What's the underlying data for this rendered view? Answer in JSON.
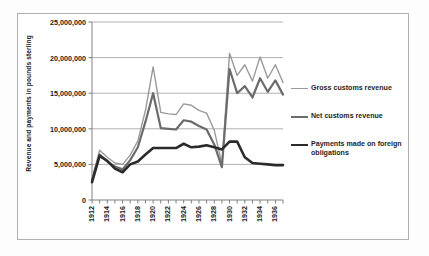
{
  "chart_data": {
    "type": "line",
    "title": "",
    "xlabel": "",
    "ylabel": "Revenue  and payments in pounds sterling",
    "ylim": [
      0,
      25000000
    ],
    "xlim": [
      1912,
      1937
    ],
    "grid": true,
    "legend_position": "right",
    "ytick_labels": [
      "25,000,000",
      "20,000,000",
      "15,000,000",
      "10,000,000",
      "5,000,000",
      "0"
    ],
    "ytick_values": [
      25000000,
      20000000,
      15000000,
      10000000,
      5000000,
      0
    ],
    "xtick_labels": [
      "1912",
      "1914",
      "1916",
      "1918",
      "1920",
      "1922",
      "1924",
      "1926",
      "1928",
      "1930",
      "1932",
      "1934",
      "1936"
    ],
    "xtick_values": [
      1912,
      1914,
      1916,
      1918,
      1920,
      1922,
      1924,
      1926,
      1928,
      1930,
      1932,
      1934,
      1936
    ],
    "x": [
      1912,
      1913,
      1914,
      1915,
      1916,
      1917,
      1918,
      1919,
      1920,
      1921,
      1922,
      1923,
      1924,
      1925,
      1926,
      1927,
      1928,
      1929,
      1930,
      1931,
      1932,
      1933,
      1934,
      1935,
      1936,
      1937
    ],
    "series": [
      {
        "name": "Gross customs revenue",
        "color": "#9a9a9a",
        "width": 1.4,
        "values": [
          3000000,
          7000000,
          6000000,
          5200000,
          5000000,
          6300000,
          8300000,
          12600000,
          18700000,
          12300000,
          12100000,
          12000000,
          13500000,
          13300000,
          12600000,
          12200000,
          9800000,
          5000000,
          20600000,
          17500000,
          19000000,
          16700000,
          20100000,
          17100000,
          19000000,
          16500000
        ]
      },
      {
        "name": "Net customs revenue",
        "color": "#6b6b6b",
        "width": 2.2,
        "values": [
          2700000,
          6400000,
          5400000,
          4700000,
          4300000,
          5600000,
          7400000,
          11000000,
          15000000,
          10100000,
          10000000,
          9900000,
          11200000,
          11000000,
          10400000,
          9900000,
          7800000,
          4600000,
          18400000,
          15000000,
          16000000,
          14400000,
          17100000,
          15200000,
          16800000,
          14800000
        ]
      },
      {
        "name": "Payments made on foreign obligations",
        "color": "#2b2b2b",
        "width": 2.6,
        "values": [
          2500000,
          6200000,
          5500000,
          4400000,
          3900000,
          5000000,
          5400000,
          6400000,
          7300000,
          7300000,
          7300000,
          7300000,
          7900000,
          7400000,
          7500000,
          7700000,
          7400000,
          7100000,
          8200000,
          8200000,
          6000000,
          5200000,
          5100000,
          5000000,
          4900000,
          4900000
        ]
      }
    ]
  },
  "legend": {
    "items": [
      {
        "label": "Gross customs revenue",
        "swatch_class": "sw-gross"
      },
      {
        "label": "Net customs revenue",
        "swatch_class": "sw-net"
      },
      {
        "label": "Payments made on foreign obligations",
        "swatch_class": "sw-pay"
      }
    ]
  },
  "colors": {
    "gross": "#9a9a9a",
    "net": "#6b6b6b",
    "payments": "#2b2b2b",
    "grid": "#a8a8a8",
    "axis": "#808080",
    "frame": "#b0b0b0",
    "background": "#ffffff"
  }
}
